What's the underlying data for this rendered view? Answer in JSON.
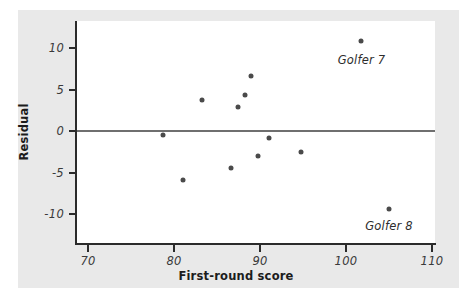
{
  "chart_data": {
    "type": "scatter",
    "title": "",
    "xlabel": "First-round score",
    "ylabel": "Residual",
    "xlim": [
      68,
      112
    ],
    "ylim": [
      -13,
      13
    ],
    "xticks": [
      70,
      80,
      90,
      100,
      110
    ],
    "yticks": [
      10,
      5,
      0,
      -5,
      -10
    ],
    "xticklabels": [
      "70",
      "80",
      "90",
      "100",
      "110"
    ],
    "yticklabels": [
      "10",
      "5",
      "0",
      "-5",
      "-10"
    ],
    "grid": false,
    "legend": "none",
    "reference_line": {
      "type": "horizontal",
      "y": 0,
      "color": "#6f6f6f"
    },
    "points": [
      {
        "x": 78.7,
        "y": -0.5
      },
      {
        "x": 81.0,
        "y": -5.9
      },
      {
        "x": 83.3,
        "y": 3.7
      },
      {
        "x": 86.6,
        "y": -4.4
      },
      {
        "x": 87.4,
        "y": 2.9
      },
      {
        "x": 88.2,
        "y": 4.3
      },
      {
        "x": 88.9,
        "y": 6.6
      },
      {
        "x": 89.8,
        "y": -3.0
      },
      {
        "x": 91.0,
        "y": -0.8
      },
      {
        "x": 94.8,
        "y": -2.5
      },
      {
        "x": 101.8,
        "y": 10.8
      },
      {
        "x": 105.0,
        "y": -9.4
      }
    ],
    "annotations": [
      {
        "text": "Golfer 7",
        "x": 101.8,
        "y": 8.5
      },
      {
        "text": "Golfer 8",
        "x": 105.0,
        "y": -11.5
      }
    ],
    "colors": {
      "marker": "#4a4a4a",
      "axis": "#2b2b2b",
      "reference_line": "#6f6f6f",
      "panel_background": "#e9e9e9",
      "plot_background": "#ffffff"
    }
  }
}
